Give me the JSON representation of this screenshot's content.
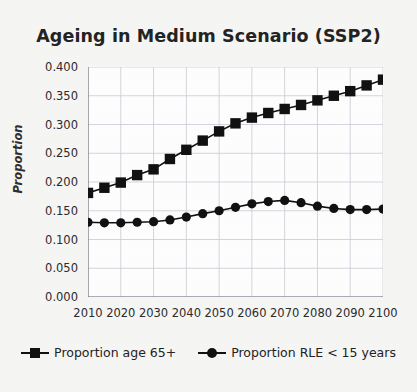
{
  "chart_data": {
    "type": "line",
    "title": "Ageing in Medium Scenario (SSP2)",
    "xlabel": "",
    "ylabel": "Proportion",
    "xlim": [
      2010,
      2100
    ],
    "ylim": [
      0.0,
      0.4
    ],
    "grid": true,
    "legend_position": "bottom",
    "x": [
      2010,
      2015,
      2020,
      2025,
      2030,
      2035,
      2040,
      2045,
      2050,
      2055,
      2060,
      2065,
      2070,
      2075,
      2080,
      2085,
      2090,
      2095,
      2100
    ],
    "xticks": [
      "2010",
      "2020",
      "2030",
      "2040",
      "2050",
      "2060",
      "2070",
      "2080",
      "2090",
      "2100"
    ],
    "yticks": [
      "0.000",
      "0.050",
      "0.100",
      "0.150",
      "0.200",
      "0.250",
      "0.300",
      "0.350",
      "0.400"
    ],
    "series": [
      {
        "name": "Proportion age 65+",
        "marker": "square",
        "color": "#111111",
        "values": [
          0.181,
          0.19,
          0.199,
          0.212,
          0.222,
          0.24,
          0.256,
          0.272,
          0.288,
          0.302,
          0.312,
          0.32,
          0.327,
          0.334,
          0.342,
          0.35,
          0.358,
          0.368,
          0.378
        ]
      },
      {
        "name": "Proportion RLE < 15 years",
        "marker": "circle",
        "color": "#111111",
        "values": [
          0.13,
          0.129,
          0.129,
          0.13,
          0.131,
          0.134,
          0.139,
          0.145,
          0.15,
          0.156,
          0.162,
          0.166,
          0.168,
          0.164,
          0.158,
          0.154,
          0.152,
          0.152,
          0.153
        ]
      }
    ]
  },
  "legend": {
    "entries": [
      {
        "label": "Proportion age 65+",
        "marker": "square-marker-icon"
      },
      {
        "label": "Proportion RLE < 15 years",
        "marker": "circle-marker-icon"
      }
    ]
  },
  "style": {
    "page_background": "#f7f7f6",
    "plot_background": "#ffffff",
    "ink": "#111111",
    "grid_color": "#c9cdd4",
    "axis_color": "#6f7379"
  }
}
